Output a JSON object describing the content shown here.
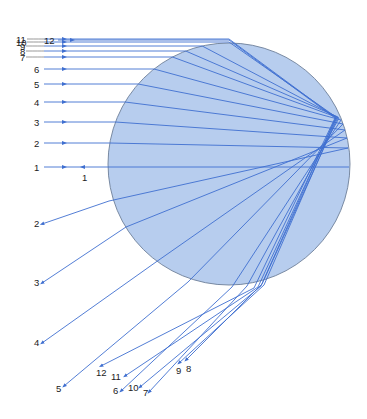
{
  "diagram": {
    "type": "ray-diagram",
    "colors": {
      "drop_fill": "#b7cdee",
      "drop_stroke": "#6d7f99",
      "ray": "#3f6fd0",
      "label": "#222222",
      "background": "#ffffff"
    },
    "drop": {
      "cx": 229,
      "cy": 164,
      "r": 121
    },
    "incoming_rays": [
      {
        "label": "1",
        "y": 167,
        "label_x": 34,
        "arrow_x": 62
      },
      {
        "label": "2",
        "y": 143,
        "label_x": 34,
        "arrow_x": 62
      },
      {
        "label": "3",
        "y": 122,
        "label_x": 34,
        "arrow_x": 62
      },
      {
        "label": "4",
        "y": 102,
        "label_x": 34,
        "arrow_x": 62
      },
      {
        "label": "5",
        "y": 84,
        "label_x": 34,
        "arrow_x": 62
      },
      {
        "label": "6",
        "y": 69,
        "label_x": 34,
        "arrow_x": 62
      },
      {
        "label": "7",
        "y": 57,
        "label_x": 20,
        "arrow_x": 62
      },
      {
        "label": "8",
        "y": 51,
        "label_x": 20,
        "arrow_x": 62
      },
      {
        "label": "9",
        "y": 46,
        "label_x": 20,
        "arrow_x": 62
      },
      {
        "label": "10",
        "y": 42,
        "label_x": 16,
        "arrow_x": 62
      },
      {
        "label": "11",
        "y": 39,
        "label_x": 16,
        "arrow_x": 62
      },
      {
        "label": "12",
        "y": 40,
        "label_x": 44,
        "arrow_x": 70
      }
    ],
    "reflected_ray": {
      "label": "1",
      "x": 82,
      "y": 178,
      "arrow_x": 80,
      "arrow_y": 167
    },
    "outgoing_rays": [
      {
        "label": "2",
        "end_x": 42,
        "end_y": 224,
        "label_x": 34,
        "label_y": 227
      },
      {
        "label": "3",
        "end_x": 42,
        "end_y": 283,
        "label_x": 34,
        "label_y": 286
      },
      {
        "label": "4",
        "end_x": 42,
        "end_y": 343,
        "label_x": 34,
        "label_y": 346
      },
      {
        "label": "5",
        "end_x": 64,
        "end_y": 386,
        "label_x": 56,
        "label_y": 392
      },
      {
        "label": "6",
        "end_x": 121,
        "end_y": 391,
        "label_x": 113,
        "label_y": 394
      },
      {
        "label": "7",
        "end_x": 149,
        "end_y": 392,
        "label_x": 143,
        "label_y": 396
      },
      {
        "label": "8",
        "end_x": 186,
        "end_y": 360,
        "label_x": 186,
        "label_y": 372
      },
      {
        "label": "9",
        "end_x": 179,
        "end_y": 363,
        "label_x": 176,
        "label_y": 374
      },
      {
        "label": "10",
        "end_x": 140,
        "end_y": 387,
        "label_x": 128,
        "label_y": 391
      },
      {
        "label": "11",
        "end_x": 125,
        "end_y": 376,
        "label_x": 111,
        "label_y": 380
      },
      {
        "label": "12",
        "end_x": 101,
        "end_y": 366,
        "label_x": 96,
        "label_y": 376
      }
    ]
  }
}
